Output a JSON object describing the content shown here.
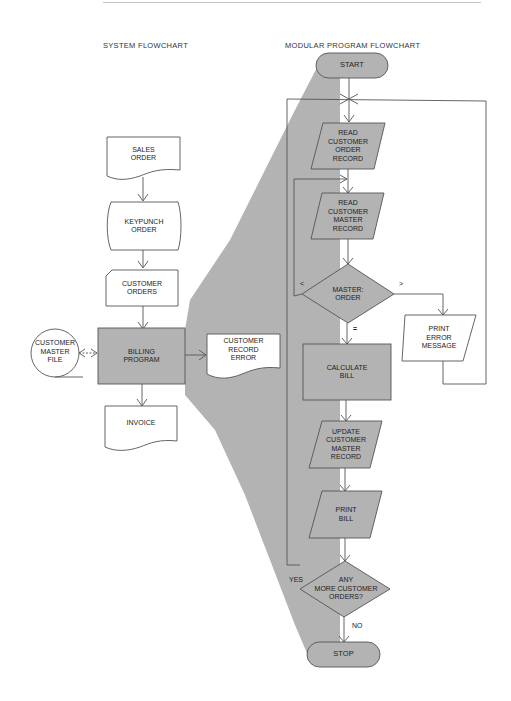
{
  "titles": {
    "system": "SYSTEM FLOWCHART",
    "modular": "MODULAR PROGRAM FLOWCHART"
  },
  "system_flowchart": {
    "sales_order": "SALES\nORDER",
    "keypunch_order": "KEYPUNCH\nORDER",
    "customer_orders": "CUSTOMER\nORDERS",
    "customer_master_file": "CUSTOMER\nMASTER\nFILE",
    "billing_program": "BILLING\nPROGRAM",
    "customer_record_error": "CUSTOMER\nRECORD\nERROR",
    "invoice": "INVOICE"
  },
  "program_flowchart": {
    "start": "START",
    "read_order": "READ\nCUSTOMER\nORDER\nRECORD",
    "read_master": "READ\nCUSTOMER\nMASTER\nRECORD",
    "compare": "MASTER:\nORDER",
    "print_error": "PRINT\nERROR\nMESSAGE",
    "calculate_bill": "CALCULATE\nBILL",
    "update_master": "UPDATE\nCUSTOMER\nMASTER\nRECORD",
    "print_bill": "PRINT\nBILL",
    "more_orders": "ANY\nMORE CUSTOMER\nORDERS?",
    "stop": "STOP",
    "edge_less": "<",
    "edge_greater": ">",
    "edge_equal": "=",
    "edge_yes": "YES",
    "edge_no": "NO"
  },
  "colors": {
    "highlight_gray": "#b3b3b3",
    "stroke": "#555555"
  }
}
